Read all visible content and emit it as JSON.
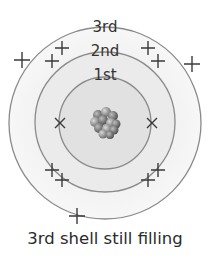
{
  "diagram": {
    "caption": "3rd shell still filling",
    "shells": [
      {
        "label": "1st",
        "radius": 46,
        "electrons": 2
      },
      {
        "label": "2nd",
        "radius": 70,
        "electrons": 8
      },
      {
        "label": "3rd",
        "radius": 96,
        "electrons": 3
      }
    ],
    "nucleus": {
      "description": "cluster of protons and neutrons"
    },
    "colors": {
      "ring": "#888888",
      "fill_outer": "#f4f4f4",
      "fill_mid": "#e9e9e9",
      "fill_inner": "#dedede",
      "electron": "#333333"
    }
  }
}
